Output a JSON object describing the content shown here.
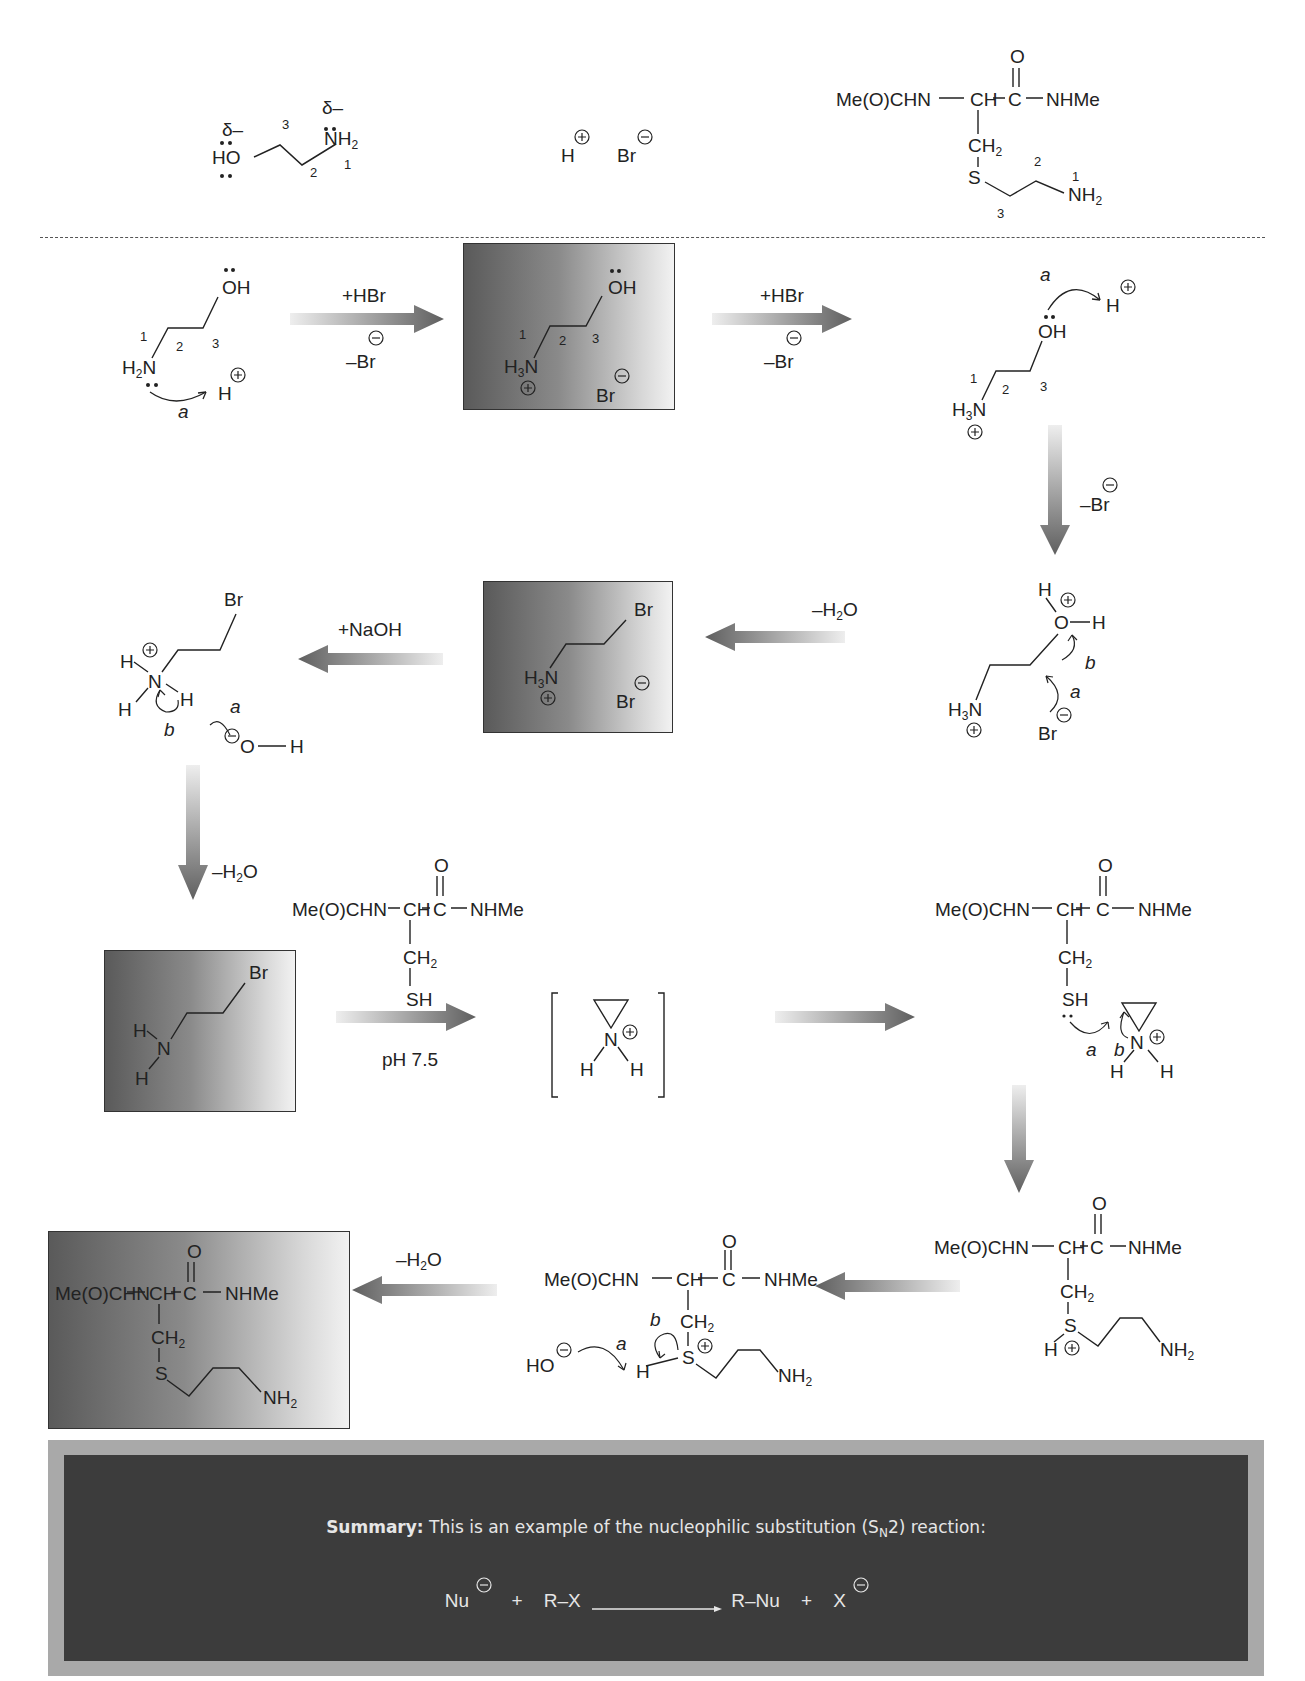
{
  "header": {
    "ethanolamine": {
      "delta1": "δ–",
      "delta2": "δ–",
      "ho": "HO",
      "nh2": "NH",
      "nh2_sub": "2",
      "n3": "3",
      "n2": "2",
      "n1": "1"
    },
    "hbr": {
      "h": "H",
      "br": "Br"
    },
    "product": {
      "me": "Me(O)CHN",
      "ch": "CH",
      "c": "C",
      "o": "O",
      "nhme": "NHMe",
      "ch2": "CH",
      "ch2_sub": "2",
      "s": "S",
      "nh2": "NH",
      "nh2_sub": "2",
      "n1": "1",
      "n2": "2",
      "n3": "3"
    }
  },
  "steps": {
    "s1": {
      "oh": "OH",
      "h2n": "H",
      "h2n_sub": "2",
      "n": "N",
      "n1": "1",
      "n2": "2",
      "n3": "3",
      "hplus": "H",
      "arrow_label": "a"
    },
    "arrow1": {
      "top": "+HBr",
      "bottom": "–Br"
    },
    "box1": {
      "oh": "OH",
      "h3n": "H",
      "h3n_sub": "3",
      "n": "N",
      "n1": "1",
      "n2": "2",
      "n3": "3",
      "br": "Br"
    },
    "arrow2": {
      "top": "+HBr",
      "bottom": "–Br"
    },
    "s3": {
      "oh": "OH",
      "h3n": "H",
      "h3n_sub": "3",
      "n": "N",
      "n1": "1",
      "n2": "2",
      "n3": "3",
      "hplus": "H",
      "arrow_label": "a"
    },
    "arrow3": {
      "label": "–Br"
    },
    "s4": {
      "h": "H",
      "o": "O",
      "h2": "H",
      "h3n": "H",
      "h3n_sub": "3",
      "n": "N",
      "br": "Br",
      "label_a": "a",
      "label_b": "b"
    },
    "arrow4": {
      "label": "–H",
      "label_sub": "2",
      "label_end": "O"
    },
    "box2": {
      "br": "Br",
      "h3n": "H",
      "h3n_sub": "3",
      "n": "N",
      "br2": "Br"
    },
    "arrow5": {
      "label": "+NaOH"
    },
    "s6": {
      "br": "Br",
      "h1": "H",
      "n": "N",
      "h2": "H",
      "h3": "H",
      "o": "O",
      "oh_h": "H",
      "label_a": "a",
      "label_b": "b"
    },
    "arrow6": {
      "label": "–H",
      "label_sub": "2",
      "label_end": "O"
    },
    "box3": {
      "br": "Br",
      "h1": "H",
      "n": "N",
      "h2": "H"
    },
    "cys1": {
      "me": "Me(O)CHN",
      "ch": "CH",
      "c": "C",
      "o": "O",
      "nhme": "NHMe",
      "ch2": "CH",
      "ch2_sub": "2",
      "sh": "SH"
    },
    "arrow7": {
      "label": "pH 7.5"
    },
    "aziridinium": {
      "n": "N",
      "h1": "H",
      "h2": "H"
    },
    "cys2": {
      "me": "Me(O)CHN",
      "ch": "CH",
      "c": "C",
      "o": "O",
      "nhme": "NHMe",
      "ch2": "CH",
      "ch2_sub": "2",
      "sh": "SH",
      "n": "N",
      "h1": "H",
      "h2": "H",
      "label_a": "a",
      "label_b": "b"
    },
    "cys3": {
      "me": "Me(O)CHN",
      "ch": "CH",
      "c": "C",
      "o": "O",
      "nhme": "NHMe",
      "ch2": "CH",
      "ch2_sub": "2",
      "s": "S",
      "h": "H",
      "nh2": "NH",
      "nh2_sub": "2"
    },
    "cys4": {
      "me": "Me(O)CHN",
      "ch": "CH",
      "c": "C",
      "o": "O",
      "nhme": "NHMe",
      "ch2": "CH",
      "ch2_sub": "2",
      "s": "S",
      "h": "H",
      "nh2": "NH",
      "nh2_sub": "2",
      "ho": "HO",
      "label_a": "a",
      "label_b": "b"
    },
    "arrow9": {
      "label": "–H",
      "label_sub": "2",
      "label_end": "O"
    },
    "box4": {
      "me": "Me(O)CHN",
      "ch": "CH",
      "c": "C",
      "o": "O",
      "nhme": "NHMe",
      "ch2": "CH",
      "ch2_sub": "2",
      "s": "S",
      "nh2": "NH",
      "nh2_sub": "2"
    }
  },
  "summary": {
    "bold": "Summary:",
    "text": " This is an example of the nucleophilic substitution (S",
    "sub": "N",
    "text_end": "2) reaction:",
    "nu": "Nu",
    "plus1": "+",
    "rx": "R–X",
    "rnu": "R–Nu",
    "plus2": "+",
    "x": "X"
  },
  "colors": {
    "box_dark": "#5a5a5a",
    "box_light": "#f2f2f2",
    "summary_bg": "#3c3c3c",
    "summary_frame": "#a9a9a9",
    "arrow": "#666666"
  }
}
